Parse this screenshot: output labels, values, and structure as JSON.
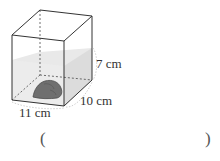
{
  "figure": {
    "shape": "rectangular-prism-container",
    "contents": "stone-submerged-in-water",
    "dimensions": {
      "length_label": "11 cm",
      "width_label": "10 cm",
      "water_height_label": "7 cm"
    }
  },
  "answer": {
    "open_paren": "(",
    "close_paren": ")",
    "value": ""
  },
  "colors": {
    "edge": "#3a3a3a",
    "water": "#e6e6e6",
    "stone": "#6e6e6e"
  }
}
